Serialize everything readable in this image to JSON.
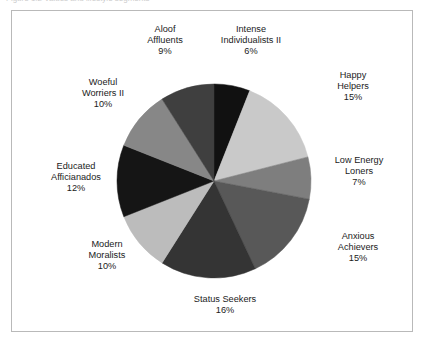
{
  "figure": {
    "caption_clipped": "Figure 1.2  Values and lifestyle segments",
    "frame_color": "#b9b9b9",
    "background": "#ffffff"
  },
  "chart_data": {
    "type": "pie",
    "title": "",
    "xlabel": "",
    "ylabel": "",
    "legend_position": "none",
    "grid": false,
    "labels_show_percent": true,
    "start_angle_deg": 0,
    "direction": "clockwise",
    "categories": [
      "Intense Individualists II",
      "Happy Helpers",
      "Low Energy Loners",
      "Anxious Achievers",
      "Status Seekers",
      "Modern Moralists",
      "Educated Afficianados",
      "Woeful Worriers II",
      "Aloof Affluents"
    ],
    "values": [
      6,
      15,
      7,
      15,
      16,
      10,
      12,
      10,
      9
    ],
    "value_labels": [
      "6%",
      "15%",
      "7%",
      "15%",
      "16%",
      "10%",
      "12%",
      "10%",
      "9%"
    ],
    "colors": [
      "#111111",
      "#c9c9c9",
      "#7e7e7e",
      "#585858",
      "#343434",
      "#bcbcbc",
      "#151515",
      "#878787",
      "#3f3f3f"
    ],
    "total": 100,
    "units": "percent"
  },
  "labels": [
    {
      "name": "Intense",
      "name2": "Individualists II",
      "value": "6%"
    },
    {
      "name": "Happy",
      "name2": "Helpers",
      "value": "15%"
    },
    {
      "name": "Low Energy",
      "name2": "Loners",
      "value": "7%"
    },
    {
      "name": "Anxious",
      "name2": "Achievers",
      "value": "15%"
    },
    {
      "name": "Status Seekers",
      "name2": "",
      "value": "16%"
    },
    {
      "name": "Modern",
      "name2": "Moralists",
      "value": "10%"
    },
    {
      "name": "Educated",
      "name2": "Afficianados",
      "value": "12%"
    },
    {
      "name": "Woeful",
      "name2": "Worriers II",
      "value": "10%"
    },
    {
      "name": "Aloof",
      "name2": "Affluents",
      "value": "9%"
    }
  ]
}
